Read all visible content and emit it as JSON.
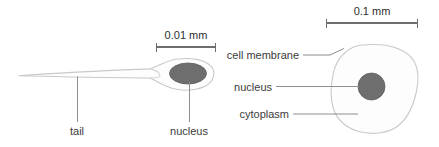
{
  "figure": {
    "background_color": "#ffffff",
    "outline_color": "#c9c9c9",
    "nucleus_color": "#6e6e6e",
    "leader_color": "#8f8f8f",
    "text_color": "#3b3b3b"
  },
  "sperm_panel": {
    "scale_bar": {
      "label": "0.01 mm",
      "value": 0.01,
      "unit": "mm",
      "x_start": 156,
      "x_end": 216,
      "y": 47
    },
    "labels": {
      "tail": "tail",
      "nucleus": "nucleus"
    }
  },
  "cell_panel": {
    "scale_bar": {
      "label": "0.1 mm",
      "value": 0.1,
      "unit": "mm",
      "x_start": 326,
      "x_end": 418,
      "y": 23
    },
    "labels": {
      "cell_membrane": "cell membrane",
      "nucleus": "nucleus",
      "cytoplasm": "cytoplasm"
    }
  }
}
